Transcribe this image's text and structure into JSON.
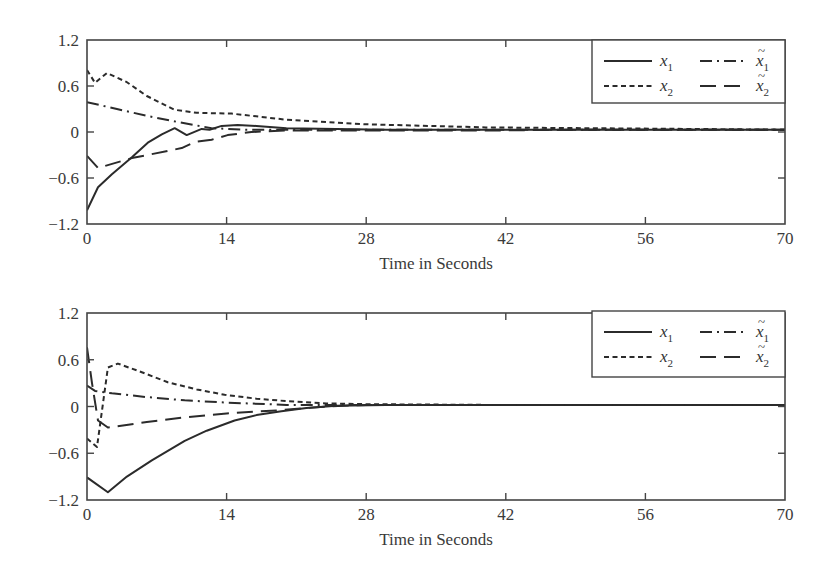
{
  "chart_data": [
    {
      "type": "line",
      "title": "",
      "xlabel": "Time in Seconds",
      "ylabel": "",
      "xlim": [
        0,
        70
      ],
      "ylim": [
        -1.2,
        1.2
      ],
      "xticks": [
        "0",
        "14",
        "28",
        "42",
        "56",
        "70"
      ],
      "yticks": [
        "1.2",
        "0.6",
        "0",
        "−0.6",
        "−1.2"
      ],
      "grid": false,
      "legend_position": "upper right",
      "legend": [
        {
          "label": "x",
          "sub": "1",
          "tilde": false,
          "style": "solid"
        },
        {
          "label": "x",
          "sub": "1",
          "tilde": true,
          "style": "dashdot"
        },
        {
          "label": "x",
          "sub": "2",
          "tilde": false,
          "style": "dotted"
        },
        {
          "label": "x",
          "sub": "2",
          "tilde": true,
          "style": "longdash"
        }
      ],
      "series": [
        {
          "name": "x1",
          "style": "solid",
          "x": [
            0,
            1.1,
            2.5,
            4.5,
            6.1,
            7.5,
            8.8,
            10,
            11.5,
            12.3,
            13.5,
            15.1,
            17,
            20,
            25,
            30,
            40,
            50,
            60,
            70
          ],
          "values": [
            -1.02,
            -0.72,
            -0.55,
            -0.33,
            -0.14,
            -0.03,
            0.05,
            -0.04,
            0.04,
            0.03,
            0.08,
            0.09,
            0.08,
            0.05,
            0.04,
            0.03,
            0.03,
            0.03,
            0.03,
            0.03
          ]
        },
        {
          "name": "x2",
          "style": "dotted",
          "x": [
            0,
            0.8,
            2,
            4,
            6,
            8.8,
            11,
            14.5,
            20,
            28,
            40,
            50,
            60,
            70
          ],
          "values": [
            0.81,
            0.64,
            0.77,
            0.65,
            0.47,
            0.29,
            0.25,
            0.24,
            0.16,
            0.1,
            0.06,
            0.05,
            0.04,
            0.03
          ]
        },
        {
          "name": "x1_tilde",
          "style": "dashdot",
          "x": [
            0,
            3,
            6,
            9.1,
            12.5,
            16,
            20,
            30,
            40,
            50,
            60,
            70
          ],
          "values": [
            0.39,
            0.3,
            0.21,
            0.13,
            0.05,
            0.03,
            0.03,
            0.03,
            0.03,
            0.03,
            0.03,
            0.03
          ]
        },
        {
          "name": "x2_tilde",
          "style": "longdash",
          "x": [
            0,
            1.1,
            4.5,
            9.5,
            10.8,
            12.5,
            14.1,
            16.5,
            20,
            30,
            40,
            50,
            60,
            70
          ],
          "values": [
            -0.31,
            -0.47,
            -0.34,
            -0.21,
            -0.13,
            -0.1,
            -0.04,
            0.0,
            0.02,
            0.02,
            0.02,
            0.03,
            0.03,
            0.03
          ]
        }
      ]
    },
    {
      "type": "line",
      "title": "",
      "xlabel": "Time in Seconds",
      "ylabel": "",
      "xlim": [
        0,
        70
      ],
      "ylim": [
        -1.2,
        1.2
      ],
      "xticks": [
        "0",
        "14",
        "28",
        "42",
        "56",
        "70"
      ],
      "yticks": [
        "1.2",
        "0.6",
        "0",
        "−0.6",
        "−1.2"
      ],
      "grid": false,
      "legend_position": "upper right",
      "legend": [
        {
          "label": "x",
          "sub": "1",
          "tilde": false,
          "style": "solid"
        },
        {
          "label": "x",
          "sub": "1",
          "tilde": true,
          "style": "dashdot"
        },
        {
          "label": "x",
          "sub": "2",
          "tilde": false,
          "style": "dotted"
        },
        {
          "label": "x",
          "sub": "2",
          "tilde": true,
          "style": "longdash"
        }
      ],
      "series": [
        {
          "name": "x1",
          "style": "solid",
          "x": [
            0,
            2.1,
            4,
            6.5,
            9.8,
            12,
            14.8,
            17,
            19.5,
            22,
            25,
            30,
            40,
            50,
            60,
            70
          ],
          "values": [
            -0.91,
            -1.1,
            -0.9,
            -0.69,
            -0.44,
            -0.31,
            -0.18,
            -0.11,
            -0.06,
            -0.02,
            0.01,
            0.02,
            0.02,
            0.02,
            0.02,
            0.02
          ]
        },
        {
          "name": "x2",
          "style": "dotted",
          "x": [
            0,
            1.0,
            2.1,
            3.1,
            5.5,
            8.1,
            11,
            13.8,
            17,
            19.9,
            24,
            28,
            40,
            50,
            60,
            70
          ],
          "values": [
            -0.41,
            -0.52,
            0.5,
            0.55,
            0.44,
            0.31,
            0.22,
            0.15,
            0.1,
            0.07,
            0.04,
            0.03,
            0.02,
            0.02,
            0.02,
            0.02
          ]
        },
        {
          "name": "x1_tilde",
          "style": "dashdot",
          "x": [
            0,
            0.8,
            2.5,
            6,
            9.8,
            14,
            20,
            28,
            40,
            50,
            60,
            70
          ],
          "values": [
            0.27,
            0.2,
            0.17,
            0.12,
            0.08,
            0.05,
            0.02,
            0.02,
            0.02,
            0.02,
            0.02,
            0.02
          ]
        },
        {
          "name": "x2_tilde",
          "style": "longdash",
          "x": [
            0,
            0.5,
            1.1,
            2.1,
            6,
            9.8,
            14,
            19,
            24,
            28,
            40,
            50,
            60,
            70
          ],
          "values": [
            0.76,
            0.3,
            -0.18,
            -0.27,
            -0.2,
            -0.14,
            -0.09,
            -0.05,
            0.0,
            0.02,
            0.02,
            0.02,
            0.02,
            0.02
          ]
        }
      ]
    }
  ]
}
